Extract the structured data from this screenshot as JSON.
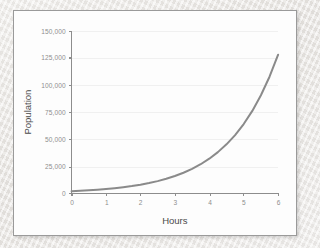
{
  "chart_data": {
    "type": "line",
    "title": "",
    "xlabel": "Hours",
    "ylabel": "Population",
    "xlim": [
      0,
      6
    ],
    "ylim": [
      0,
      150000
    ],
    "grid": true,
    "legend": false,
    "x_ticks": [
      "0",
      "1",
      "2",
      "3",
      "4",
      "5",
      "6"
    ],
    "x_tick_values": [
      0,
      1,
      2,
      3,
      4,
      5,
      6
    ],
    "y_ticks": [
      "0",
      "25,000",
      "50,000",
      "75,000",
      "100,000",
      "125,000",
      "150,000"
    ],
    "y_tick_values": [
      0,
      25000,
      50000,
      75000,
      100000,
      125000,
      150000
    ],
    "series": [
      {
        "name": "Population",
        "color": "#8a8a8a",
        "x": [
          0,
          0.25,
          0.5,
          0.75,
          1,
          1.25,
          1.5,
          1.75,
          2,
          2.25,
          2.5,
          2.75,
          3,
          3.25,
          3.5,
          3.75,
          4,
          4.25,
          4.5,
          4.75,
          5,
          5.25,
          5.5,
          5.75,
          6
        ],
        "values": [
          2000,
          2378,
          2828,
          3364,
          4000,
          4757,
          5657,
          6727,
          8000,
          9514,
          11314,
          13454,
          16000,
          19027,
          22627,
          26909,
          32000,
          38055,
          45255,
          53817,
          64000,
          76109,
          90510,
          107634,
          128000
        ]
      }
    ]
  }
}
